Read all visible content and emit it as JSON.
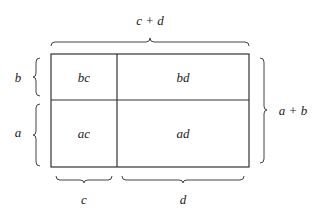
{
  "diagram": {
    "labels": {
      "top": "c + d",
      "right": "a + b",
      "left_top": "b",
      "left_bottom": "a",
      "bottom_left": "c",
      "bottom_right": "d"
    },
    "cells": {
      "top_left": "bc",
      "top_right": "bd",
      "bottom_left": "ac",
      "bottom_right": "ad"
    },
    "colors": {
      "line": "#333333",
      "text": "#222222",
      "background": "#ffffff"
    }
  }
}
